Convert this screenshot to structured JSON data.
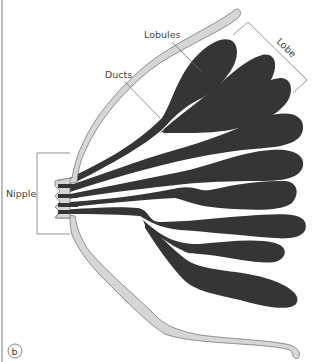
{
  "diagram": {
    "panel_label": "b",
    "labels": {
      "lobules": "Lobules",
      "ducts": "Ducts",
      "lobe": "Lobe",
      "nipple": "Nipple"
    },
    "colors": {
      "skin_fill": "#d6d6d6",
      "skin_stroke": "#777777",
      "lobe_fill": "#353535",
      "leader_line": "#666666",
      "text": "#444444",
      "border": "#bdbdbd"
    }
  }
}
